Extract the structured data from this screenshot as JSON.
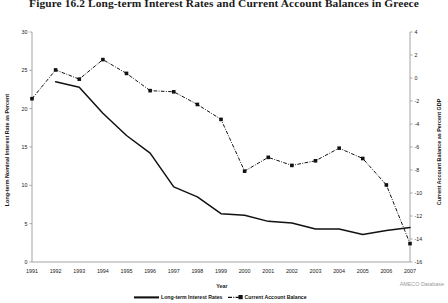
{
  "figure": {
    "title": "Figure 16.2   Long-term Interest Rates and Current Account Balances in Greece",
    "source": "AMECO Database"
  },
  "chart_data": {
    "type": "line",
    "title": "Long-term Interest Rates and Current Account Balances in Greece",
    "xlabel": "Year",
    "ylabel": "Long-term Nominal Interest Rate as Percent",
    "y2label": "Current Account Balance as Percent GDP",
    "grid": false,
    "legend_position": "bottom",
    "x": [
      1991,
      1992,
      1993,
      1994,
      1995,
      1996,
      1997,
      1998,
      1999,
      2000,
      2001,
      2002,
      2003,
      2004,
      2005,
      2006,
      2007
    ],
    "categories": [
      "1991",
      "1992",
      "1993",
      "1994",
      "1995",
      "1996",
      "1997",
      "1998",
      "1999",
      "2000",
      "2001",
      "2002",
      "2003",
      "2004",
      "2005",
      "2006",
      "2007"
    ],
    "ylim": [
      0,
      30
    ],
    "yticks": [
      0,
      5,
      10,
      15,
      20,
      25,
      30
    ],
    "y2lim": [
      -16,
      4
    ],
    "y2ticks": [
      4,
      2,
      0,
      -2,
      -4,
      -6,
      -8,
      -10,
      -12,
      -14,
      -16
    ],
    "series": [
      {
        "name": "Long-term Interest Rates",
        "axis": "left",
        "style": "solid",
        "markers": false,
        "values": [
          null,
          23.5,
          22.8,
          19.4,
          16.5,
          14.2,
          9.8,
          8.5,
          6.3,
          6.1,
          5.3,
          5.1,
          4.3,
          4.3,
          3.6,
          4.1,
          4.5
        ]
      },
      {
        "name": "Current Account Balance",
        "axis": "right",
        "style": "dash-dot",
        "markers": true,
        "values": [
          -1.8,
          0.7,
          -0.1,
          1.6,
          0.4,
          -1.1,
          -1.2,
          -2.3,
          -3.6,
          -8.1,
          -6.9,
          -7.6,
          -7.2,
          -6.1,
          -7.0,
          -9.3,
          -14.4
        ]
      }
    ]
  }
}
